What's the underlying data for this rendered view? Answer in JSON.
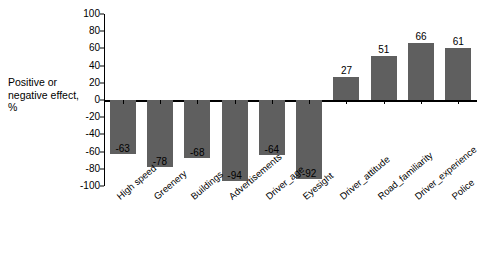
{
  "chart_data": {
    "type": "bar",
    "title": "",
    "xlabel": "",
    "ylabel": "Positive or negative effect, %",
    "ylim": [
      -100,
      100
    ],
    "yticks": [
      100,
      80,
      60,
      40,
      20,
      0,
      -20,
      -40,
      -60,
      -80,
      -100
    ],
    "ytick_labels": [
      "100",
      "80",
      "60",
      "40",
      "20",
      "0",
      "-20",
      "-40",
      "-60",
      "-80",
      "-100"
    ],
    "grid": false,
    "legend": "none",
    "bar_color": "#5f5f5f",
    "categories": [
      "High speed",
      "Greenery",
      "Buildings",
      "Advertisements",
      "Driver_age",
      "Eyesight",
      "Driver_attitude",
      "Road_familiarity",
      "Driver_experience",
      "Police"
    ],
    "values": [
      -63,
      -78,
      -68,
      -94,
      -64,
      -92,
      27,
      51,
      66,
      61
    ],
    "data_labels": [
      "-63",
      "-78",
      "-68",
      "-94",
      "-64",
      "-92",
      "27",
      "51",
      "66",
      "61"
    ]
  }
}
